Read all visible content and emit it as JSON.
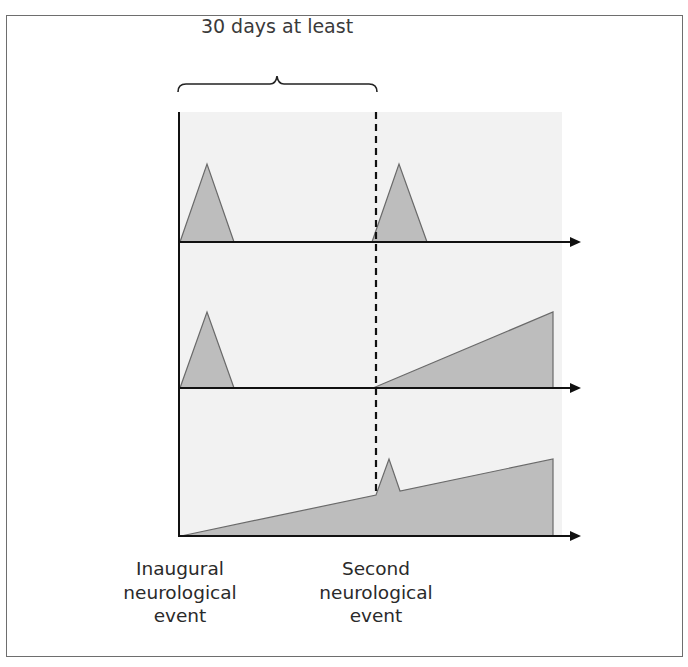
{
  "figure": {
    "interval_label": "30 days at least",
    "events": [
      {
        "lines": [
          "Inaugural",
          "neurological",
          "event"
        ],
        "x": 180
      },
      {
        "lines": [
          "Second",
          "neurological",
          "event"
        ],
        "x": 376
      }
    ],
    "colors": {
      "panel_background": "#f2f2f2",
      "fill": "#bdbdbd",
      "fill_stroke": "#6a6a6a",
      "axis": "#111111",
      "frame": "#6e6e6e"
    },
    "panels": [
      {
        "name": "relapsing-remitting",
        "shapes": [
          "triangle at inaugural event",
          "triangle at second event"
        ]
      },
      {
        "name": "relapse-then-progressive",
        "shapes": [
          "triangle at inaugural event",
          "ramp starting at second event"
        ]
      },
      {
        "name": "progressive-with-relapse",
        "shapes": [
          "ramp from inaugural event",
          "spike at second event",
          "continued ramp"
        ]
      }
    ]
  }
}
